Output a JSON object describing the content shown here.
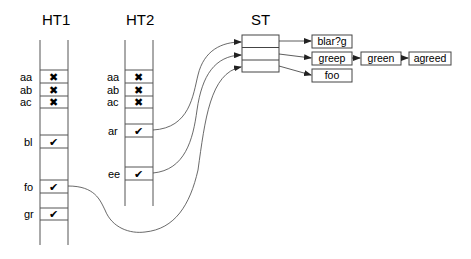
{
  "titles": {
    "ht1": "HT1",
    "ht2": "HT2",
    "st": "ST"
  },
  "ht1": {
    "rows": [
      {
        "key": "aa",
        "mark": "✖"
      },
      {
        "key": "ab",
        "mark": "✖"
      },
      {
        "key": "ac",
        "mark": "✖"
      },
      {
        "key": "bl",
        "mark": "✔"
      },
      {
        "key": "fo",
        "mark": "✔"
      },
      {
        "key": "gr",
        "mark": "✔"
      }
    ]
  },
  "ht2": {
    "rows": [
      {
        "key": "aa",
        "mark": "✖"
      },
      {
        "key": "ab",
        "mark": "✖"
      },
      {
        "key": "ac",
        "mark": "✖"
      },
      {
        "key": "ar",
        "mark": "✔"
      },
      {
        "key": "ee",
        "mark": "✔"
      }
    ]
  },
  "st": {
    "chains": [
      [
        "blar?g"
      ],
      [
        "greep",
        "green",
        "agreed"
      ],
      [
        "foo"
      ]
    ]
  },
  "colors": {
    "line": "#555555",
    "box": "#444444",
    "text": "#1a1a1a"
  }
}
